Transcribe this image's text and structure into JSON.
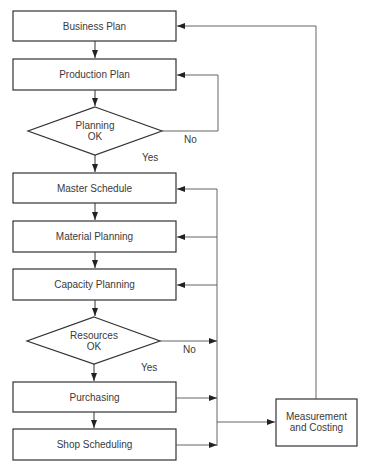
{
  "diagram": {
    "type": "flowchart",
    "colors": {
      "stroke": "#333333",
      "connector": "#555555",
      "background": "#ffffff",
      "text": "#3a3a3a"
    },
    "nodes": [
      {
        "id": "business_plan",
        "shape": "rect",
        "label": "Business Plan"
      },
      {
        "id": "production_plan",
        "shape": "rect",
        "label": "Production Plan"
      },
      {
        "id": "planning_ok",
        "shape": "diamond",
        "label_line1": "Planning",
        "label_line2": "OK"
      },
      {
        "id": "master_schedule",
        "shape": "rect",
        "label": "Master Schedule"
      },
      {
        "id": "material_planning",
        "shape": "rect",
        "label": "Material Planning"
      },
      {
        "id": "capacity_planning",
        "shape": "rect",
        "label": "Capacity Planning"
      },
      {
        "id": "resources_ok",
        "shape": "diamond",
        "label_line1": "Resources",
        "label_line2": "OK"
      },
      {
        "id": "purchasing",
        "shape": "rect",
        "label": "Purchasing"
      },
      {
        "id": "shop_scheduling",
        "shape": "rect",
        "label": "Shop Scheduling"
      },
      {
        "id": "measurement_costing",
        "shape": "rect",
        "label_line1": "Measurement",
        "label_line2": "and Costing"
      }
    ],
    "edge_labels": {
      "planning_no": "No",
      "planning_yes": "Yes",
      "resources_no": "No",
      "resources_yes": "Yes"
    },
    "edges": [
      {
        "from": "business_plan",
        "to": "production_plan"
      },
      {
        "from": "production_plan",
        "to": "planning_ok"
      },
      {
        "from": "planning_ok",
        "to": "production_plan",
        "label": "No"
      },
      {
        "from": "planning_ok",
        "to": "master_schedule",
        "label": "Yes"
      },
      {
        "from": "master_schedule",
        "to": "material_planning"
      },
      {
        "from": "material_planning",
        "to": "capacity_planning"
      },
      {
        "from": "capacity_planning",
        "to": "resources_ok"
      },
      {
        "from": "resources_ok",
        "to": "feedback_bus",
        "label": "No"
      },
      {
        "from": "resources_ok",
        "to": "purchasing",
        "label": "Yes"
      },
      {
        "from": "purchasing",
        "to": "shop_scheduling"
      },
      {
        "from": "purchasing",
        "to": "feedback_bus"
      },
      {
        "from": "shop_scheduling",
        "to": "feedback_bus"
      },
      {
        "from": "feedback_bus",
        "to": "master_schedule"
      },
      {
        "from": "feedback_bus",
        "to": "material_planning"
      },
      {
        "from": "feedback_bus",
        "to": "capacity_planning"
      },
      {
        "from": "feedback_bus",
        "to": "measurement_costing"
      },
      {
        "from": "measurement_costing",
        "to": "business_plan"
      }
    ]
  }
}
